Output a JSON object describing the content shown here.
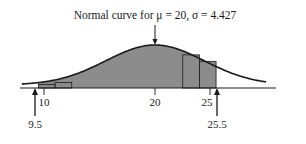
{
  "chart_data": {
    "type": "area",
    "title": "Normal curve for μ = 20, σ = 4.427",
    "xlabel": "",
    "ylabel": "",
    "grid": false,
    "legend": null,
    "distribution": {
      "name": "normal",
      "mu": 20,
      "sigma": 4.427
    },
    "shaded_region": {
      "from": 9.5,
      "to": 25.5
    },
    "x_ticks": [
      {
        "value": 10,
        "label": "10"
      },
      {
        "value": 20,
        "label": "20"
      },
      {
        "value": 25,
        "label": "25"
      }
    ],
    "annotations": [
      {
        "value": 9.5,
        "label": "9.5",
        "type": "arrow-up"
      },
      {
        "value": 25.5,
        "label": "25.5",
        "type": "arrow-up"
      },
      {
        "target": "curve-peak",
        "label": "Normal curve for μ = 20, σ = 4.427",
        "type": "arrow-down"
      }
    ],
    "histogram_bars": [
      {
        "from": 9.5,
        "to": 11,
        "height_rel": 0.08
      },
      {
        "from": 11,
        "to": 12.5,
        "height_rel": 0.13
      },
      {
        "from": 22.5,
        "to": 24,
        "height_rel": 0.77
      },
      {
        "from": 24,
        "to": 25.5,
        "height_rel": 0.62
      }
    ],
    "xlim": [
      8,
      30
    ]
  },
  "labels": {
    "title": "Normal curve for μ = 20, σ = 4.427",
    "tick_10": "10",
    "tick_20": "20",
    "tick_25": "25",
    "marker_low": "9.5",
    "marker_high": "25.5"
  },
  "colors": {
    "fill": "#8c8c8c",
    "line": "#1a1a1a"
  }
}
